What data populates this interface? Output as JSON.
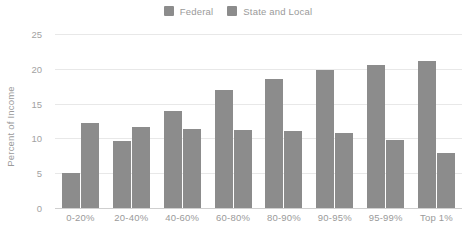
{
  "chart_data": {
    "type": "bar",
    "title": "",
    "subtitle": "",
    "xlabel": "",
    "ylabel": "Percent of Income",
    "categories": [
      "0-20%",
      "20-40%",
      "40-60%",
      "60-80%",
      "80-90%",
      "90-95%",
      "95-99%",
      "Top 1%"
    ],
    "series": [
      {
        "name": "Federal",
        "color": "#8c8c8c",
        "values": [
          5.0,
          9.6,
          13.9,
          17.0,
          18.5,
          19.8,
          20.5,
          21.1
        ]
      },
      {
        "name": "State and Local",
        "color": "#8c8c8c",
        "values": [
          12.2,
          11.7,
          11.3,
          11.2,
          11.0,
          10.8,
          9.8,
          7.9
        ]
      }
    ],
    "ylim": [
      0,
      25
    ],
    "yticks": [
      0,
      5,
      10,
      15,
      20,
      25
    ],
    "ytick_labels": [
      "0",
      "5",
      "10",
      "15",
      "20",
      "25"
    ],
    "grid": true,
    "grid_axis": "y",
    "legend_position": "top-center",
    "background_color": "#ffffff",
    "gridline_color": "#e8e8e8",
    "axis_line_color": "#cfcfcf",
    "tick_label_color": "#9a9a9a"
  },
  "legend": {
    "entries": [
      {
        "label": "Federal",
        "color": "#8c8c8c"
      },
      {
        "label": "State and Local",
        "color": "#8c8c8c"
      }
    ]
  }
}
